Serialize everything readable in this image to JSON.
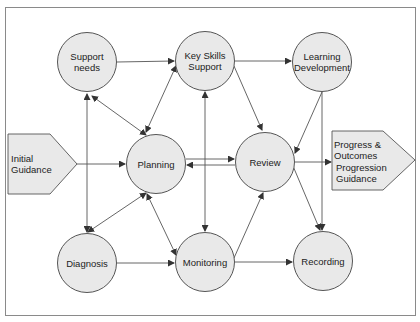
{
  "diagram": {
    "title": "",
    "colors": {
      "node_fill": "#e9e9e9",
      "stroke": "#555555",
      "frame": "#8a8a8a"
    },
    "nodes": {
      "support_needs": {
        "label": "Support needs"
      },
      "key_skills": {
        "label": "Key Skills\nSupport"
      },
      "learning_dev": {
        "label": "Learning\nDevelopment"
      },
      "planning": {
        "label": "Planning"
      },
      "review": {
        "label": "Review"
      },
      "diagnosis": {
        "label": "Diagnosis"
      },
      "monitoring": {
        "label": "Monitoring"
      },
      "recording": {
        "label": "Recording"
      }
    },
    "inputs": {
      "initial_guidance": {
        "label": "Initial\nGuidance"
      }
    },
    "outputs": {
      "progress": {
        "label_top": "Progress &\nOutcomes",
        "label_bottom": "Progression\nGuidance"
      }
    },
    "edges": [
      {
        "from": "Support needs",
        "to": "Key Skills Support",
        "type": "arrow"
      },
      {
        "from": "Key Skills Support",
        "to": "Learning Development",
        "type": "arrow"
      },
      {
        "from": "Support needs",
        "to": "Planning",
        "type": "double-arrow"
      },
      {
        "from": "Diagnosis",
        "to": "Support needs",
        "type": "arrow"
      },
      {
        "from": "Support needs",
        "to": "Diagnosis",
        "type": "arrow"
      },
      {
        "from": "Key Skills Support",
        "to": "Planning",
        "type": "double-arrow"
      },
      {
        "from": "Key Skills Support",
        "to": "Review",
        "type": "arrow"
      },
      {
        "from": "Key Skills Support",
        "to": "Monitoring",
        "type": "double-arrow"
      },
      {
        "from": "Learning Development",
        "to": "Review",
        "type": "arrow"
      },
      {
        "from": "Learning Development",
        "to": "Recording",
        "type": "arrow"
      },
      {
        "from": "Initial Guidance",
        "to": "Planning",
        "type": "arrow"
      },
      {
        "from": "Planning",
        "to": "Review",
        "type": "arrow"
      },
      {
        "from": "Review",
        "to": "Planning",
        "type": "arrow"
      },
      {
        "from": "Review",
        "to": "Progress & Outcomes",
        "type": "arrow"
      },
      {
        "from": "Review",
        "to": "Recording",
        "type": "arrow"
      },
      {
        "from": "Planning",
        "to": "Diagnosis",
        "type": "double-arrow"
      },
      {
        "from": "Planning",
        "to": "Monitoring",
        "type": "double-arrow"
      },
      {
        "from": "Diagnosis",
        "to": "Monitoring",
        "type": "arrow"
      },
      {
        "from": "Monitoring",
        "to": "Review",
        "type": "arrow"
      },
      {
        "from": "Monitoring",
        "to": "Recording",
        "type": "arrow"
      }
    ]
  }
}
